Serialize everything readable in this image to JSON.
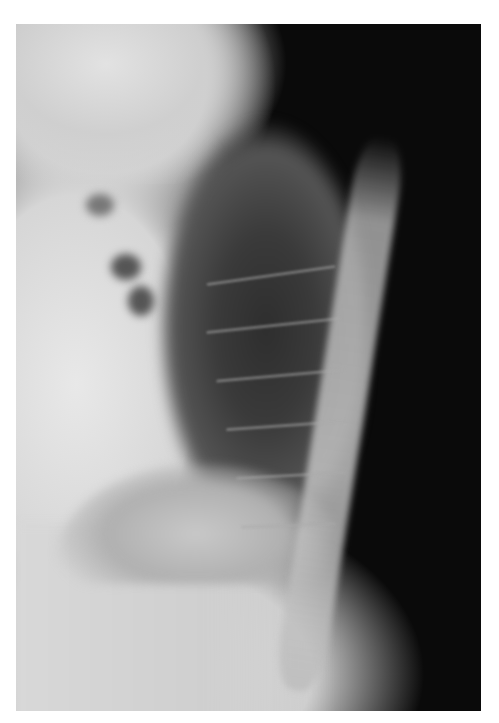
{
  "image": {
    "subject": "lateral chest radiograph",
    "style": "grayscale x-ray",
    "colors": {
      "background": "#ffffff",
      "film_dark": "#0a0a0a",
      "soft_tissue": "#d6d6d6",
      "lung_field": "#333333",
      "bone": "#c8c8c8"
    },
    "frame": {
      "left": 16,
      "top": 24,
      "width": 465,
      "height": 687
    }
  }
}
